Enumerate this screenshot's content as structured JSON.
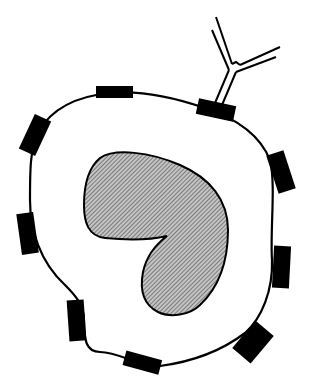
{
  "diagram": {
    "type": "schematic",
    "colors": {
      "background": "#ffffff",
      "outline": "#000000",
      "receptor_fill": "#000000",
      "nucleus_fill": "#b8b8b8",
      "nucleus_hatch": "#555555"
    },
    "components": {
      "cell_membrane": {
        "label": ""
      },
      "nucleus": {
        "label": "",
        "shape": "kidney",
        "pattern": "diagonal-hatch"
      },
      "antibody": {
        "label": "",
        "shape": "Y",
        "attached_to": "receptor-top-right"
      },
      "receptors": [
        {
          "id": "receptor-top",
          "x": 96,
          "y": 86,
          "w": 37,
          "h": 12,
          "rot": 0
        },
        {
          "id": "receptor-top-right",
          "x": 197,
          "y": 102,
          "w": 38,
          "h": 16,
          "rot": 12
        },
        {
          "id": "receptor-upper-left",
          "x": 26,
          "y": 120,
          "w": 18,
          "h": 38,
          "rot": 25
        },
        {
          "id": "receptor-right-upper",
          "x": 272,
          "y": 152,
          "w": 18,
          "h": 40,
          "rot": -18
        },
        {
          "id": "receptor-left",
          "x": 19,
          "y": 213,
          "w": 17,
          "h": 41,
          "rot": -8
        },
        {
          "id": "receptor-right-lower",
          "x": 273,
          "y": 246,
          "w": 17,
          "h": 42,
          "rot": 3
        },
        {
          "id": "receptor-lower-left",
          "x": 68,
          "y": 300,
          "w": 17,
          "h": 41,
          "rot": -4
        },
        {
          "id": "receptor-bottom-right",
          "x": 241,
          "y": 324,
          "w": 24,
          "h": 36,
          "rot": 40
        },
        {
          "id": "receptor-bottom",
          "x": 124,
          "y": 355,
          "w": 37,
          "h": 16,
          "rot": 15
        }
      ]
    }
  }
}
